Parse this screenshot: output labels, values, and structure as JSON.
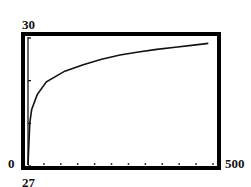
{
  "chart_data": {
    "type": "line",
    "title": "",
    "xlabel": "",
    "ylabel": "",
    "window": {
      "xmin": 0,
      "xmax": 500,
      "ymin": 0,
      "ymax": 30
    },
    "xlim": [
      0,
      500
    ],
    "ylim": [
      0,
      30
    ],
    "labels": {
      "ymax": "30",
      "ymin": "0",
      "xmax": "500",
      "below": "27"
    },
    "grid": false,
    "axis_ticks": {
      "x_tick_dots": 11,
      "y_ticks": 4
    },
    "series": [
      {
        "name": "curve",
        "description": "logarithmic-shaped increasing curve",
        "x": [
          1,
          5,
          10,
          25,
          50,
          100,
          150,
          200,
          250,
          300,
          350,
          400,
          450,
          490
        ],
        "y": [
          2,
          10,
          13,
          16.5,
          19.5,
          22,
          23.5,
          24.8,
          25.8,
          26.5,
          27.1,
          27.6,
          28.1,
          28.5
        ]
      }
    ],
    "colors": {
      "frame": "#000000",
      "curve": "#111111",
      "background": "#ffffff"
    }
  }
}
